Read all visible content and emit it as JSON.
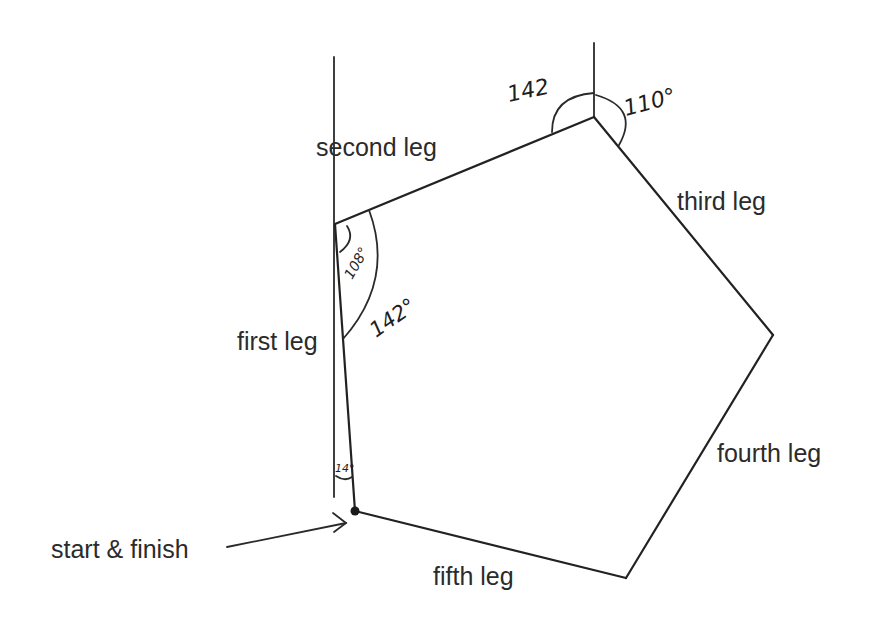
{
  "diagram": {
    "type": "compass-bearing-route",
    "shape": "pentagon",
    "vertices": {
      "start": [
        355,
        511
      ],
      "v1": [
        335,
        224
      ],
      "v2": [
        594,
        117
      ],
      "v3": [
        773,
        335
      ],
      "v4": [
        626,
        578
      ]
    },
    "legs": [
      {
        "id": "first",
        "label": "first leg"
      },
      {
        "id": "second",
        "label": "second leg"
      },
      {
        "id": "third",
        "label": "third leg"
      },
      {
        "id": "fourth",
        "label": "fourth leg"
      },
      {
        "id": "fifth",
        "label": "fifth leg"
      }
    ],
    "angles": {
      "start_bearing": "14°",
      "vertex1_small": "108°",
      "vertex1_large": "142°",
      "vertex2_left": "142",
      "vertex2_right": "110°"
    },
    "start_label": "start & finish",
    "colors": {
      "line": "#222222",
      "text": "#2b2b2b",
      "background": "#ffffff"
    }
  }
}
